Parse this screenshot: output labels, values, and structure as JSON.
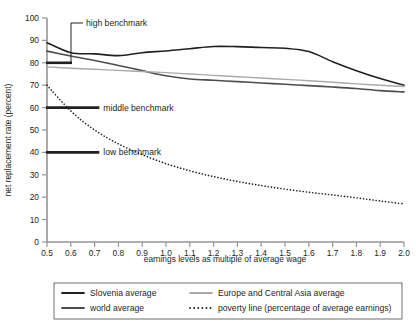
{
  "chart_data": {
    "type": "line",
    "title": "",
    "xlabel": "earnings levels as multiple of average wage",
    "ylabel": "net replacement rate (percent)",
    "xlim": [
      0.5,
      2.0
    ],
    "ylim": [
      0,
      100
    ],
    "grid": false,
    "legend_position": "bottom",
    "x": [
      0.5,
      0.6,
      0.7,
      0.8,
      0.9,
      1.0,
      1.1,
      1.2,
      1.3,
      1.4,
      1.5,
      1.6,
      1.7,
      1.8,
      1.9,
      2.0
    ],
    "xticklabels": [
      "0.5",
      "0.6",
      "0.7",
      "0.8",
      "0.9",
      "1.0",
      "1.1",
      "1.2",
      "1.3",
      "1.4",
      "1.5",
      "1.6",
      "1.7",
      "1.8",
      "1.9",
      "2.0"
    ],
    "yticklabels": [
      "0",
      "10",
      "20",
      "30",
      "40",
      "50",
      "60",
      "70",
      "80",
      "90",
      "100"
    ],
    "yticks": [
      0,
      10,
      20,
      30,
      40,
      50,
      60,
      70,
      80,
      90,
      100
    ],
    "series": [
      {
        "name": "Slovenia average",
        "color": "#231f20",
        "style": "solid",
        "width": 1.6,
        "values": [
          89.0,
          84.5,
          84.0,
          83.2,
          84.5,
          85.3,
          86.3,
          87.3,
          87.2,
          86.8,
          86.5,
          85.0,
          80.5,
          76.5,
          73.0,
          70.0
        ]
      },
      {
        "name": "world average",
        "color": "#4d4d4f",
        "style": "solid",
        "width": 1.6,
        "values": [
          85.2,
          83.0,
          81.0,
          78.8,
          76.5,
          74.2,
          72.8,
          72.2,
          71.6,
          71.0,
          70.4,
          69.8,
          69.2,
          68.5,
          67.6,
          67.0
        ]
      },
      {
        "name": "Europe and Central Asia average",
        "color": "#a7a9ac",
        "style": "solid",
        "width": 1.4,
        "values": [
          78.2,
          77.6,
          77.1,
          76.6,
          76.1,
          75.6,
          75.0,
          74.4,
          73.8,
          73.2,
          72.6,
          72.0,
          71.3,
          70.6,
          70.0,
          69.4
        ]
      },
      {
        "name": "poverty line (percentage of average earnings)",
        "color": "#231f20",
        "style": "dotted",
        "width": 1.6,
        "values": [
          70.0,
          58.5,
          50.0,
          43.8,
          39.0,
          35.0,
          31.8,
          29.2,
          27.0,
          25.2,
          23.6,
          22.2,
          21.0,
          19.7,
          18.3,
          17.0
        ]
      }
    ],
    "annotations": [
      {
        "name": "high-benchmark",
        "label": "high benchmark",
        "value": 80,
        "bar_x_start": 0.5,
        "bar_x_end": 0.605,
        "leader": true
      },
      {
        "name": "middle-benchmark",
        "label": "middle benchmark",
        "value": 60,
        "bar_x_start": 0.5,
        "bar_x_end": 0.72,
        "leader": false
      },
      {
        "name": "low-benchmark",
        "label": "low benchmark",
        "value": 40,
        "bar_x_start": 0.5,
        "bar_x_end": 0.72,
        "leader": false
      }
    ]
  },
  "legend": {
    "items": [
      {
        "label": "Slovenia average",
        "color": "#231f20",
        "style": "solid"
      },
      {
        "label": "Europe and Central Asia average",
        "color": "#a7a9ac",
        "style": "solid"
      },
      {
        "label": "world average",
        "color": "#4d4d4f",
        "style": "solid"
      },
      {
        "label": "poverty line (percentage of average earnings)",
        "color": "#231f20",
        "style": "dotted"
      }
    ],
    "border_color": "#6d6e71"
  },
  "colors": {
    "axis": "#939598",
    "text": "#231f20",
    "background": "#ffffff"
  }
}
